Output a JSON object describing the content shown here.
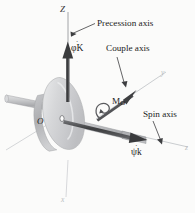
{
  "figure": {
    "labels": {
      "axis_Z": "Z",
      "precession_axis": "Precession axis",
      "precession_vector": "φK",
      "couple_axis": "Couple axis",
      "axis_y": "y",
      "moment": "M",
      "moment_subscript": "O",
      "spin_axis": "Spin axis",
      "spin_vector": "ψk",
      "axis_z": "z",
      "origin": "O",
      "axis_x": "x",
      "dot_accent": "˙"
    },
    "colors": {
      "background": "#fbfbfa",
      "ink": "#2b2b2b",
      "vector_dark": "#3c3c3c",
      "axis_line": "#6f6f6f",
      "axis_faint": "#c3c6ca",
      "disk_face": "#d3d4d6",
      "disk_face_light": "#e6e7e8",
      "disk_rim": "#b9babd",
      "shaft": "#c8c9cb",
      "shaft_shade": "#9b9c9f"
    },
    "elements": {
      "disk": "flywheel-disk",
      "shaft": "spin-shaft",
      "precession_arrow": "precession-vector-arrow",
      "couple_arrow": "couple-moment-arrow",
      "couple_curl": "couple-rotation-curl",
      "spin_arrow": "spin-vector-arrow",
      "origin_point": "origin-marker",
      "leader_precession": "leader-line-precession",
      "leader_couple": "leader-line-couple",
      "leader_spin": "leader-line-spin"
    }
  }
}
